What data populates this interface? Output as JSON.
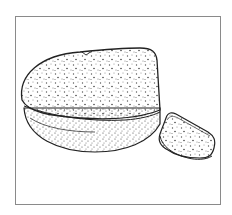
{
  "illustration": {
    "subject": "Bread loaf with a cut slice",
    "style": "stippled pen-and-ink line drawing",
    "colors": {
      "background": "#ffffff",
      "frame": "#8a8a8a",
      "ink": "#222222",
      "stipple": "#555555"
    },
    "elements": [
      {
        "name": "loaf",
        "label": "Bread loaf"
      },
      {
        "name": "slice",
        "label": "Bread slice"
      }
    ]
  }
}
